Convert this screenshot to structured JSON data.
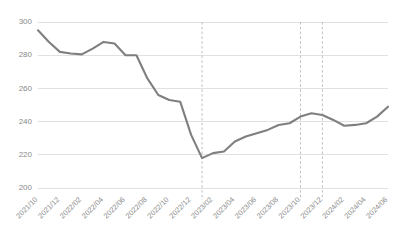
{
  "chart_data": {
    "type": "line",
    "title": "",
    "subtitle": "",
    "xlabel": "",
    "ylabel": "",
    "grid": "horizontal",
    "legend_position": "none",
    "ylim": [
      200,
      300
    ],
    "ytick_labels": [
      "300",
      "280",
      "260",
      "240",
      "220",
      "200"
    ],
    "ytick_values": [
      300,
      280,
      260,
      240,
      220,
      200
    ],
    "xtick_labels": [
      "2021/10",
      "2021/12",
      "2022/02",
      "2022/04",
      "2022/06",
      "2022/08",
      "2022/10",
      "2022/12",
      "2023/02",
      "2023/04",
      "2023/06",
      "2023/08",
      "2023/10",
      "2023/12",
      "2024/02",
      "2024/04",
      "2024/06"
    ],
    "x": [
      "2021/10",
      "2021/11",
      "2021/12",
      "2022/01",
      "2022/02",
      "2022/03",
      "2022/04",
      "2022/05",
      "2022/06",
      "2022/07",
      "2022/08",
      "2022/09",
      "2022/10",
      "2022/11",
      "2022/12",
      "2023/01",
      "2023/02",
      "2023/03",
      "2023/04",
      "2023/05",
      "2023/06",
      "2023/07",
      "2023/08",
      "2023/09",
      "2023/10",
      "2023/11",
      "2023/12",
      "2024/01",
      "2024/02",
      "2024/03",
      "2024/04",
      "2024/05",
      "2024/06"
    ],
    "series": [
      {
        "name": "value",
        "color": "#7f7f7f",
        "values": [
          295,
          288,
          282,
          281,
          280.5,
          284,
          288,
          287,
          280,
          280,
          266,
          256,
          253,
          252,
          232,
          218,
          221,
          222,
          228,
          231,
          233,
          235,
          238,
          239,
          243,
          245,
          244,
          241,
          237.5,
          238,
          239,
          243,
          249
        ]
      }
    ],
    "annotations": [
      {
        "name": "event-marker-1",
        "x": "2023/01",
        "style": "dashed-vertical"
      },
      {
        "name": "event-marker-2",
        "x": "2023/10",
        "style": "dashed-vertical"
      },
      {
        "name": "event-marker-3",
        "x": "2023/12",
        "style": "dashed-vertical"
      }
    ],
    "colors": {
      "line": "#7f7f7f",
      "grid": "#d9d9d9",
      "event_line": "#b9b9b9",
      "tick_text": "#8a8a8a",
      "background": "#ffffff"
    }
  }
}
